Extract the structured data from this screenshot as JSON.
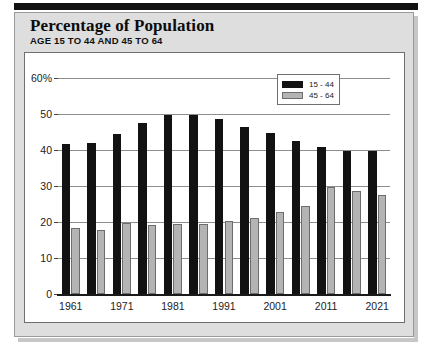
{
  "header": {
    "title": "Percentage of Population",
    "subtitle": "AGE 15 TO 44 AND 45 TO 64"
  },
  "legend": {
    "items": [
      {
        "label": "15 - 44",
        "color": "#121212",
        "swatch": "legend-swatch-black"
      },
      {
        "label": "45 - 64",
        "color": "#b4b4b4",
        "swatch": "legend-swatch-gray"
      }
    ]
  },
  "chart_data": {
    "type": "bar",
    "title": "Percentage of Population",
    "subtitle": "AGE 15 TO 44 AND 45 TO 64",
    "xlabel": "",
    "ylabel": "",
    "ylim": [
      0,
      60
    ],
    "yticks": [
      0,
      10,
      20,
      30,
      40,
      50,
      60
    ],
    "ytick_labels": [
      "0",
      "10",
      "20",
      "30",
      "40",
      "50",
      "60%"
    ],
    "grid": true,
    "legend_position": "top-right",
    "categories": [
      "1961",
      "1966",
      "1971",
      "1976",
      "1981",
      "1986",
      "1991",
      "1996",
      "2001",
      "2006",
      "2011",
      "2016",
      "2021"
    ],
    "xtick_labels_shown": [
      "1961",
      "1971",
      "1981",
      "1991",
      "2001",
      "2011",
      "2021"
    ],
    "series": [
      {
        "name": "15 - 44",
        "color": "#121212",
        "values": [
          41.8,
          42.0,
          44.5,
          47.5,
          49.7,
          49.8,
          48.5,
          46.5,
          44.6,
          42.6,
          40.8,
          39.8,
          39.6
        ]
      },
      {
        "name": "45 - 64",
        "color": "#b4b4b4",
        "values": [
          18.2,
          17.8,
          19.6,
          19.3,
          19.4,
          19.5,
          20.4,
          21.2,
          22.8,
          24.5,
          29.7,
          28.6,
          27.6
        ]
      }
    ]
  }
}
